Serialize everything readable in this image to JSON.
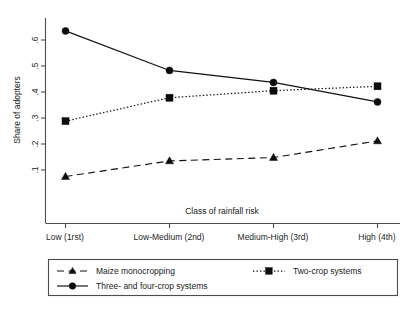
{
  "chart_data": {
    "type": "line",
    "title": "",
    "xlabel": "Class of rainfall risk",
    "ylabel": "Share of adopters",
    "categories": [
      "Low (1rst)",
      "Low-Medium (2nd)",
      "Medium-High (3rd)",
      "High (4th)"
    ],
    "ylim": [
      0.0,
      0.68
    ],
    "yticks": [
      0.1,
      0.2,
      0.3,
      0.4,
      0.5,
      0.6
    ],
    "ytick_labels": [
      ".1",
      ".2",
      ".3",
      ".4",
      ".5",
      ".6"
    ],
    "grid": false,
    "legend_position": "below-plot",
    "series": [
      {
        "name": "Maize monocropping",
        "marker": "triangle",
        "linestyle": "dashed",
        "color": "#111111",
        "values": [
          0.075,
          0.135,
          0.148,
          0.212
        ]
      },
      {
        "name": "Two-crop systems",
        "marker": "square",
        "linestyle": "dotted",
        "color": "#111111",
        "values": [
          0.288,
          0.378,
          0.405,
          0.422
        ]
      },
      {
        "name": "Three- and four-crop systems",
        "marker": "circle",
        "linestyle": "solid",
        "color": "#111111",
        "values": [
          0.635,
          0.483,
          0.437,
          0.362
        ]
      }
    ]
  },
  "axes": {
    "y_title": "Share of adopters",
    "x_title": "Class of rainfall risk",
    "ytick_0": ".1",
    "ytick_1": ".2",
    "ytick_2": ".3",
    "ytick_3": ".4",
    "ytick_4": ".5",
    "ytick_5": ".6",
    "xtick_0": "Low (1rst)",
    "xtick_1": "Low-Medium (2nd)",
    "xtick_2": "Medium-High (3rd)",
    "xtick_3": "High (4th)"
  },
  "legend": {
    "item_0": "Maize monocropping",
    "item_1": "Two-crop systems",
    "item_2": "Three- and four-crop systems"
  }
}
